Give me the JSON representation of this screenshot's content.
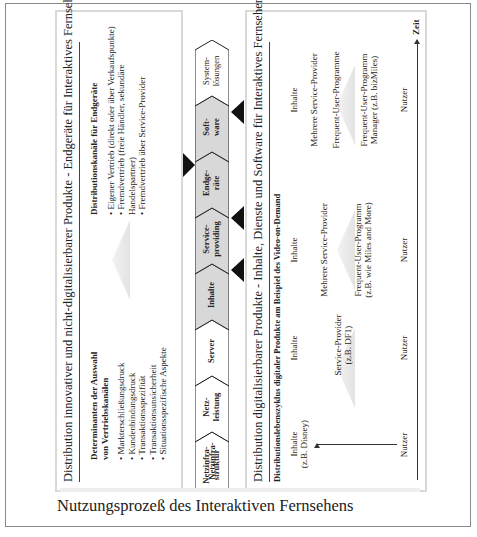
{
  "figure": {
    "top_panel": {
      "title": "Distribution innovativer und nicht-digitalisierbarer Produkte - Endgeräte für Interaktives Fernsehen",
      "left_column": {
        "heading_line1": "Determinanten der Auswahl",
        "heading_line2": "von Vertriebskanälen",
        "items": [
          "Markterschließungsdruck",
          "Kundenbindungsdruck",
          "Transaktionsspezifität",
          "Transaktionsunsicherheit",
          "Situationsspezifische Aspekte"
        ]
      },
      "right_column": {
        "heading": "Distributionskanäle für Endgeräte",
        "items": [
          "Eigener Vertrieb (direkt oder über Verkaufspunkte)",
          "Fremdvertrieb (freie Händler, sekundäre Handelspartner)",
          "Fremdvertrieb über Service-Provider"
        ]
      }
    },
    "value_chain": {
      "stages": [
        {
          "label_1": "Netzinfra-",
          "label_2": "struktur",
          "shaded": false
        },
        {
          "label_1": "Netz-",
          "label_2": "leistung",
          "shaded": false
        },
        {
          "label_1": "Server",
          "label_2": "",
          "shaded": false
        },
        {
          "label_1": "Inhalte",
          "label_2": "",
          "shaded": true
        },
        {
          "label_1": "Service-",
          "label_2": "providing",
          "shaded": true
        },
        {
          "label_1": "Endge-",
          "label_2": "räte",
          "shaded": true
        },
        {
          "label_1": "Soft-",
          "label_2": "ware",
          "shaded": true
        },
        {
          "label_1": "System-",
          "label_2": "lösungen",
          "shaded": false
        }
      ]
    },
    "bottom_panel": {
      "title": "Distribution digitalisierbarer Produkte - Inhalte, Dienste und Software für Interaktives Fernsehen",
      "subtitle": "Distributionslebenszyklus digitaler Produkte am Beispiel des Video-on-Demand",
      "phases": [
        {
          "nodes": [
            "Inhalte (z.B. Disney)",
            "Nutzer"
          ]
        },
        {
          "nodes": [
            "Inhalte",
            "Service-Provider (z.B. DF1)",
            "Nutzer"
          ]
        },
        {
          "nodes": [
            "Inhalte",
            "Mehrere Service-Provider",
            "Frequent-User-Programm (z.B. wie Miles and More)",
            "Nutzer"
          ]
        },
        {
          "nodes": [
            "Inhalte",
            "Mehrere Service-Provider",
            "Frequent-User-Programme",
            "Frequent-User-Programm Manager (z.B. bizMiles)",
            "Nutzer"
          ]
        }
      ],
      "phase1_line1": "Inhalte",
      "phase1_line2": "(z.B. Disney)",
      "phase1_end": "Nutzer",
      "phase2_start": "Inhalte",
      "phase2_mid1": "Service-Provider",
      "phase2_mid2": "(z.B. DF1)",
      "phase2_end": "Nutzer",
      "phase3_start": "Inhalte",
      "phase3_mid": "Mehrere Service-Provider",
      "phase3_fup1": "Frequent-User-Programm",
      "phase3_fup2": "(z.B. wie Miles and More)",
      "phase3_end": "Nutzer",
      "phase4_start": "Inhalte",
      "phase4_mid": "Mehrere Service-Provider",
      "phase4_fups": "Frequent-User-Programme",
      "phase4_mgr1": "Frequent-User-Programm",
      "phase4_mgr2": "Manager (z.B. bizMiles)",
      "phase4_end": "Nutzer",
      "time_axis_label": "Zeit"
    }
  },
  "caption": "Nutzungsprozeß des Interaktiven Fernsehens"
}
